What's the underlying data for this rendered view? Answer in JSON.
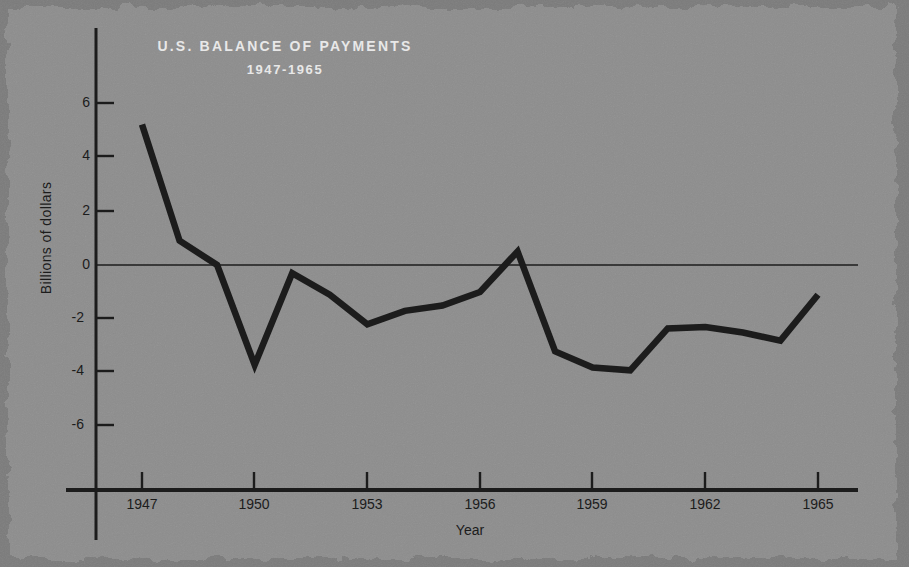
{
  "chart_data": {
    "type": "line",
    "title": "U.S. BALANCE OF PAYMENTS",
    "subtitle": "1947-1965",
    "xlabel": "Year",
    "ylabel": "Billions of dollars",
    "xlim": [
      1946.6,
      1965.6
    ],
    "ylim": [
      -7.4,
      7.2
    ],
    "ytick_labels": [
      "6",
      "4",
      "2",
      "0",
      "-2",
      "-4",
      "-6"
    ],
    "ytick_values": [
      6,
      4,
      2,
      0,
      -2,
      -4,
      -6
    ],
    "xtick_labels": [
      "1947",
      "1950",
      "1953",
      "1956",
      "1959",
      "1962",
      "1965"
    ],
    "xtick_values": [
      1947,
      1950,
      1953,
      1956,
      1959,
      1962,
      1965
    ],
    "grid": false,
    "legend": "none",
    "zero_line": true,
    "series": [
      {
        "name": "U.S. balance of payments",
        "color": "#1c1c1c",
        "x": [
          1947,
          1948,
          1949,
          1950,
          1951,
          1952,
          1953,
          1954,
          1955,
          1956,
          1957,
          1958,
          1959,
          1960,
          1961,
          1962,
          1963,
          1964,
          1965
        ],
        "values": [
          5.2,
          0.9,
          0.0,
          -3.7,
          -0.3,
          -1.1,
          -2.2,
          -1.7,
          -1.5,
          -1.0,
          0.5,
          -3.2,
          -3.8,
          -3.9,
          -2.35,
          -2.3,
          -2.5,
          -2.8,
          -1.1
        ]
      }
    ]
  },
  "colors": {
    "background": "#8a8a8a",
    "line": "#1c1c1c",
    "axis": "#1c1c1c",
    "title_text": "#e8e8e8",
    "tick_text": "#1c1c1c"
  }
}
